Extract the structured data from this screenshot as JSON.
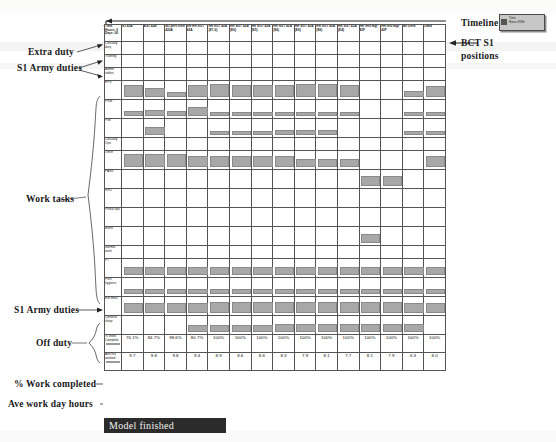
{
  "annotations": {
    "extra_duty": "Extra duty",
    "s1_army_duties_top": "S1 Army duties",
    "work_tasks": "Work tasks",
    "s1_army_duties_bottom": "S1 Army duties",
    "off_duty": "Off duty",
    "pct_work_completed": "% Work completed",
    "ave_work_day_hours": "Ave work day hours",
    "timeline": "Timeline",
    "bct_s1_positions_line1": "BCT S1",
    "bct_s1_positions_line2": "positions"
  },
  "legend_chip": {
    "line1": "Time",
    "line2": "Hours  8590"
  },
  "status_bar": {
    "label": "Model finished"
  },
  "table": {
    "corner_header": "Time\nHours: 0\nDays: 00",
    "columns": [
      "S1 43A",
      "AS1 42B",
      "MJ pers tech 420A",
      "SR HR SGT 42A",
      "HR SGT 42A (E7-6)",
      "HR SGT 42A (E6)",
      "HR SGT 42A (E5)",
      "HR SGT 42A (E6)",
      "HR SGT 42A (E6)",
      "HR SGT 42A (E6)",
      "HR SGT 42A (E4)",
      "HR Info Mgr 42F",
      "HR Info Mgr 42F",
      "Mil clerk",
      "DMM"
    ],
    "rows": [
      {
        "label": "Casualty duty",
        "group": "extra",
        "height": "short",
        "bars": [
          0,
          0,
          0,
          0,
          0,
          0,
          0,
          0,
          0,
          0,
          0,
          0,
          0,
          0,
          0
        ]
      },
      {
        "label": "Training",
        "group": "s1top",
        "height": "short",
        "bars": [
          0,
          0,
          0,
          0,
          0,
          0,
          0,
          0,
          0,
          0,
          0,
          0,
          0,
          0,
          0
        ]
      },
      {
        "label": "Admin tables",
        "group": "s1top",
        "height": "short",
        "bars": [
          0,
          0,
          0,
          0,
          0,
          0,
          0,
          0,
          0,
          0,
          0,
          0,
          0,
          0,
          0
        ]
      },
      {
        "label": "EPS",
        "group": "work",
        "height": "tall",
        "bars": [
          55,
          40,
          18,
          55,
          60,
          58,
          58,
          58,
          60,
          60,
          55,
          0,
          0,
          22,
          48
        ]
      },
      {
        "label": "PRM",
        "group": "work",
        "height": "tall",
        "bars": [
          18,
          22,
          18,
          40,
          10,
          10,
          10,
          10,
          10,
          10,
          10,
          0,
          0,
          10,
          10
        ]
      },
      {
        "label": "PIM",
        "group": "work",
        "height": "tall",
        "bars": [
          0,
          34,
          0,
          0,
          12,
          12,
          12,
          18,
          18,
          18,
          0,
          0,
          0,
          12,
          12
        ]
      },
      {
        "label": "Casualty Ops",
        "group": "work",
        "height": "short",
        "bars": [
          0,
          0,
          0,
          0,
          0,
          0,
          0,
          0,
          0,
          0,
          0,
          0,
          0,
          0,
          0
        ]
      },
      {
        "label": "Other",
        "group": "work",
        "height": "tall",
        "bars": [
          62,
          62,
          62,
          48,
          48,
          48,
          48,
          48,
          34,
          34,
          34,
          0,
          0,
          0,
          52
        ]
      },
      {
        "label": "PASR",
        "group": "work",
        "height": "tall",
        "bars": [
          0,
          0,
          0,
          0,
          0,
          0,
          0,
          0,
          0,
          0,
          0,
          46,
          46,
          0,
          0
        ]
      },
      {
        "label": "RRO",
        "group": "work",
        "height": "tall",
        "bars": [
          0,
          0,
          0,
          0,
          0,
          0,
          0,
          0,
          0,
          0,
          0,
          0,
          0,
          0,
          0
        ]
      },
      {
        "label": "Postal ops",
        "group": "work",
        "height": "tall",
        "bars": [
          0,
          0,
          0,
          0,
          0,
          0,
          0,
          0,
          0,
          0,
          0,
          0,
          0,
          0,
          0
        ]
      },
      {
        "label": "MWR",
        "group": "work",
        "height": "tall",
        "bars": [
          0,
          0,
          0,
          0,
          0,
          0,
          0,
          0,
          0,
          0,
          0,
          40,
          0,
          0,
          0
        ]
      },
      {
        "label": "Normal work",
        "group": "work",
        "height": "short",
        "bars": [
          0,
          0,
          0,
          0,
          0,
          0,
          0,
          0,
          0,
          0,
          0,
          0,
          0,
          0,
          0
        ]
      },
      {
        "label": "PT",
        "group": "s1bottom",
        "height": "tall",
        "bars": [
          34,
          34,
          34,
          34,
          34,
          34,
          34,
          34,
          34,
          34,
          34,
          34,
          34,
          34,
          34
        ]
      },
      {
        "label": "Pers hygiene",
        "group": "off",
        "height": "tall",
        "bars": [
          16,
          16,
          16,
          16,
          16,
          16,
          16,
          16,
          16,
          16,
          16,
          16,
          16,
          16,
          16
        ]
      },
      {
        "label": "Eat meal",
        "group": "off",
        "height": "tall",
        "bars": [
          44,
          44,
          44,
          44,
          48,
          48,
          48,
          48,
          48,
          48,
          48,
          48,
          48,
          44,
          44
        ]
      },
      {
        "label": "Optional sleep",
        "group": "off",
        "height": "tall",
        "bars": [
          0,
          0,
          0,
          30,
          30,
          26,
          26,
          34,
          34,
          34,
          34,
          34,
          34,
          34,
          0
        ]
      }
    ],
    "summary": [
      {
        "label": "% Work Complete",
        "values": [
          "76.1%",
          "84.7%",
          "98.6%",
          "80.7%",
          "100%",
          "100%",
          "100%",
          "100%",
          "100%",
          "100%",
          "100%",
          "100%",
          "100%",
          "100%",
          "100%"
        ]
      },
      {
        "label": "Ave hrs worked",
        "values": [
          "9.7",
          "9.8",
          "9.8",
          "9.4",
          "8.9",
          "8.6",
          "8.6",
          "8.3",
          "7.9",
          "8.1",
          "7.7",
          "8.1",
          "7.9",
          "6.3",
          "8.0"
        ]
      }
    ]
  }
}
